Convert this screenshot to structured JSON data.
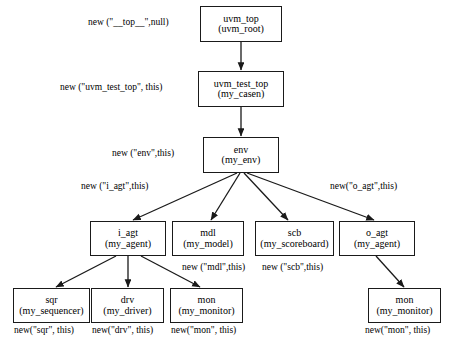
{
  "diagram": {
    "type": "uvm-testbench-hierarchy",
    "nodes": [
      {
        "id": "uvm_top",
        "title": "uvm_top",
        "sub": "(uvm_root)",
        "x": 200,
        "y": 6,
        "w": 82,
        "h": 36
      },
      {
        "id": "uvm_test_top",
        "title": "uvm_test_top",
        "sub": "(my_casen)",
        "x": 198,
        "y": 71,
        "w": 86,
        "h": 36
      },
      {
        "id": "env",
        "title": "env",
        "sub": "(my_env)",
        "x": 203,
        "y": 137,
        "w": 76,
        "h": 36
      },
      {
        "id": "i_agt",
        "title": "i_agt",
        "sub": "(my_agent)",
        "x": 90,
        "y": 221,
        "w": 76,
        "h": 35
      },
      {
        "id": "mdl",
        "title": "mdl",
        "sub": "(my_model)",
        "x": 172,
        "y": 221,
        "w": 72,
        "h": 35
      },
      {
        "id": "scb",
        "title": "scb",
        "sub": "(my_scoreboard)",
        "x": 255,
        "y": 221,
        "w": 79,
        "h": 35
      },
      {
        "id": "o_agt",
        "title": "o_agt",
        "sub": "(my_agent)",
        "x": 339,
        "y": 221,
        "w": 76,
        "h": 35
      },
      {
        "id": "sqr",
        "title": "sqr",
        "sub": "(my_sequencer)",
        "x": 13,
        "y": 288,
        "w": 77,
        "h": 35
      },
      {
        "id": "drv",
        "title": "drv",
        "sub": "(my_driver)",
        "x": 91,
        "y": 288,
        "w": 73,
        "h": 35
      },
      {
        "id": "mon_i",
        "title": "mon",
        "sub": "(my_monitor)",
        "x": 170,
        "y": 288,
        "w": 73,
        "h": 35
      },
      {
        "id": "mon_o",
        "title": "mon",
        "sub": "(my_monitor)",
        "x": 368,
        "y": 288,
        "w": 73,
        "h": 35
      }
    ],
    "edge_labels": [
      {
        "id": "lbl_top",
        "text": "new (\"__top__\",null)",
        "x": 88,
        "y": 18,
        "align": "left"
      },
      {
        "id": "lbl_test_top",
        "text": "new (\"uvm_test_top\", this)",
        "x": 60,
        "y": 83,
        "align": "left"
      },
      {
        "id": "lbl_env",
        "text": "new (\"env\",this)",
        "x": 112,
        "y": 149,
        "align": "left"
      },
      {
        "id": "lbl_i_agt",
        "text": "new (\"i_agt\",this)",
        "x": 81,
        "y": 182,
        "align": "left"
      },
      {
        "id": "lbl_o_agt",
        "text": "new(\"o_agt\",this)",
        "x": 330,
        "y": 182,
        "align": "left"
      },
      {
        "id": "lbl_mdl",
        "text": "new (\"mdl\",this)",
        "x": 182,
        "y": 263,
        "align": "left"
      },
      {
        "id": "lbl_scb",
        "text": "new (\"scb\",this)",
        "x": 262,
        "y": 263,
        "align": "left"
      },
      {
        "id": "lbl_sqr",
        "text": "new(\"sqr\", this)",
        "x": 14,
        "y": 326,
        "align": "left"
      },
      {
        "id": "lbl_drv",
        "text": "new(\"drv\", this)",
        "x": 92,
        "y": 326,
        "align": "left"
      },
      {
        "id": "lbl_mon_i",
        "text": "new(\"mon\", this)",
        "x": 171,
        "y": 326,
        "align": "left"
      },
      {
        "id": "lbl_mon_o",
        "text": "new(\"mon\", this)",
        "x": 365,
        "y": 326,
        "align": "left"
      }
    ],
    "edges": [
      {
        "id": "edge-uvm_top-uvm_test_top",
        "from": "uvm_top",
        "to": "uvm_test_top",
        "x1": 241,
        "y1": 42,
        "x2": 241,
        "y2": 70
      },
      {
        "id": "edge-uvm_test_top-env",
        "from": "uvm_test_top",
        "to": "env",
        "x1": 241,
        "y1": 107,
        "x2": 241,
        "y2": 136
      },
      {
        "id": "edge-env-i_agt",
        "from": "env",
        "to": "i_agt",
        "x1": 237,
        "y1": 173,
        "x2": 133,
        "y2": 220
      },
      {
        "id": "edge-env-mdl",
        "from": "env",
        "to": "mdl",
        "x1": 240,
        "y1": 173,
        "x2": 211,
        "y2": 220
      },
      {
        "id": "edge-env-scb",
        "from": "env",
        "to": "scb",
        "x1": 244,
        "y1": 173,
        "x2": 288,
        "y2": 220
      },
      {
        "id": "edge-env-o_agt",
        "from": "env",
        "to": "o_agt",
        "x1": 247,
        "y1": 173,
        "x2": 374,
        "y2": 220
      },
      {
        "id": "edge-i_agt-sqr",
        "from": "i_agt",
        "to": "sqr",
        "x1": 116,
        "y1": 256,
        "x2": 56,
        "y2": 287
      },
      {
        "id": "edge-i_agt-drv",
        "from": "i_agt",
        "to": "drv",
        "x1": 128,
        "y1": 256,
        "x2": 128,
        "y2": 287
      },
      {
        "id": "edge-i_agt-mon_i",
        "from": "i_agt",
        "to": "mon_i",
        "x1": 141,
        "y1": 256,
        "x2": 200,
        "y2": 287
      },
      {
        "id": "edge-o_agt-mon_o",
        "from": "o_agt",
        "to": "mon_o",
        "x1": 376,
        "y1": 256,
        "x2": 404,
        "y2": 287
      }
    ],
    "colors": {
      "background": "#ffffff",
      "stroke": "#1a1a1a",
      "text": "#000000"
    }
  }
}
